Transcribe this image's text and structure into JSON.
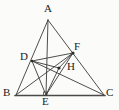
{
  "figure": {
    "type": "geometry-diagram",
    "background_color": "#fbfbfa",
    "stroke_color": "#3a3a3a",
    "base_stroke_color": "#4a4a4a",
    "label_color": "#1c1c1c"
  },
  "points": {
    "A": {
      "label": "A",
      "x": 48,
      "y": 20,
      "label_x": 44,
      "label_y": 5
    },
    "B": {
      "label": "B",
      "x": 16,
      "y": 95,
      "label_x": 3,
      "label_y": 88
    },
    "C": {
      "label": "C",
      "x": 104,
      "y": 95,
      "label_x": 107,
      "label_y": 88
    },
    "D": {
      "label": "D",
      "x": 32,
      "y": 61,
      "label_x": 20,
      "label_y": 51
    },
    "E": {
      "label": "E",
      "x": 46,
      "y": 95,
      "label_x": 42,
      "label_y": 96
    },
    "F": {
      "label": "F",
      "x": 73,
      "y": 53,
      "label_x": 74,
      "label_y": 41
    },
    "H": {
      "label": "H",
      "x": 59,
      "y": 68,
      "label_x": 68,
      "label_y": 62
    }
  },
  "segments": [
    {
      "name": "AB",
      "from": "A",
      "to": "B"
    },
    {
      "name": "AC",
      "from": "A",
      "to": "C"
    },
    {
      "name": "BC",
      "from": "B",
      "to": "C",
      "emphasis": "thick"
    },
    {
      "name": "AE",
      "from": "A",
      "to": "E"
    },
    {
      "name": "BF",
      "from": "B",
      "to": "F"
    },
    {
      "name": "CD",
      "from": "C",
      "to": "D"
    },
    {
      "name": "DF",
      "from": "D",
      "to": "F"
    },
    {
      "name": "DE",
      "from": "D",
      "to": "E"
    },
    {
      "name": "EF",
      "from": "E",
      "to": "F"
    },
    {
      "name": "DH",
      "from": "D",
      "to": "H"
    },
    {
      "name": "FH",
      "from": "F",
      "to": "H"
    },
    {
      "name": "EH",
      "from": "E",
      "to": "H"
    }
  ],
  "marks": {
    "right_angle_at": "E",
    "right_angle_label": "right-angle-mark-at-E",
    "interior_point": "H"
  }
}
